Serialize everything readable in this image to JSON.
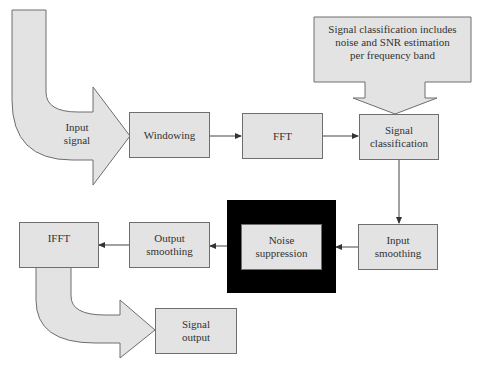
{
  "diagram": {
    "nodes": {
      "input_signal": "Input\nsignal",
      "windowing": "Windowing",
      "fft": "FFT",
      "signal_classification": "Signal\nclassification",
      "callout": "Signal classification includes\nnoise and SNR estimation\nper frequency band",
      "input_smoothing": "Input\nsmoothing",
      "noise_suppression": "Noise\nsuppression",
      "output_smoothing": "Output\nsmoothing",
      "ifft": "IFFT",
      "signal_output": "Signal\noutput"
    },
    "edges": [
      {
        "from": "Input signal",
        "to": "Windowing"
      },
      {
        "from": "Windowing",
        "to": "FFT"
      },
      {
        "from": "FFT",
        "to": "Signal classification"
      },
      {
        "from": "Signal classification",
        "to": "Input smoothing"
      },
      {
        "from": "Input smoothing",
        "to": "Noise suppression"
      },
      {
        "from": "Noise suppression",
        "to": "Output smoothing"
      },
      {
        "from": "Output smoothing",
        "to": "IFFT"
      },
      {
        "from": "IFFT",
        "to": "Signal output"
      }
    ],
    "colors": {
      "box_fill": "#e3e3e3",
      "box_border": "#6e6e6e",
      "highlight_frame": "#000000",
      "line": "#444444"
    }
  }
}
